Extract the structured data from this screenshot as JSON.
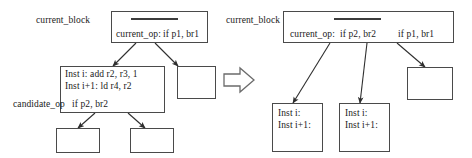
{
  "diagram": {
    "caption": "",
    "transform_arrow": "block-arrow-right"
  },
  "left": {
    "current_block_label": "current_block",
    "candidate_op_label": "candidate_op",
    "header_box": {
      "elided_marker": "————",
      "op_label": "current_op:",
      "branch": "if p1, br1"
    },
    "body_box": {
      "inst1": "Inst i: add r2, r3, 1",
      "inst2": "Inst i+1: ld r4, r2",
      "branch": "if p2,  br2"
    },
    "empty_boxes": [
      "",
      "",
      ""
    ]
  },
  "right": {
    "current_block_label": "current_block",
    "header_box": {
      "elided_marker": "————",
      "op_label": "current_op:",
      "branch1": "if p2, br2",
      "branch2": "if p1, br1"
    },
    "dup_box_1": {
      "inst1": "Inst i:",
      "inst2": "Inst i+1:"
    },
    "dup_box_2": {
      "inst1": "Inst i:",
      "inst2": "Inst i+1:"
    },
    "empty_boxes": [
      ""
    ]
  },
  "colors": {
    "stroke": "#4a4a4a",
    "arrow": "#2e2e2e",
    "text": "#1a1a1a",
    "background": "#ffffff"
  }
}
